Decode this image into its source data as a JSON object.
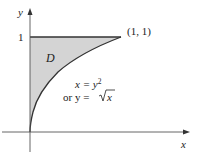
{
  "diagram": {
    "type": "region-plot",
    "axes": {
      "x_label": "x",
      "y_label": "y",
      "y_tick": "1"
    },
    "region": {
      "label": "D",
      "fill": "#d4d4d4"
    },
    "point_label": "(1, 1)",
    "curve_eq_1": "x = y",
    "curve_eq_1_exp": "2",
    "curve_eq_2_prefix": "or y = ",
    "curve_eq_2_sqrt_arg": "x",
    "colors": {
      "line": "#222222",
      "shade": "#d4d4d4"
    }
  }
}
